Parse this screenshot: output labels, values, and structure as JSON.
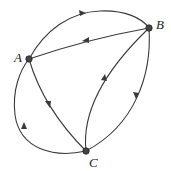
{
  "diagram": {
    "type": "directed-graph",
    "nodes": [
      {
        "id": "A",
        "label": "A",
        "x": 29,
        "y": 59
      },
      {
        "id": "B",
        "label": "B",
        "x": 149,
        "y": 28
      },
      {
        "id": "C",
        "label": "C",
        "x": 86,
        "y": 151
      }
    ],
    "edges": [
      {
        "from": "A",
        "to": "B",
        "shape": "curved-top"
      },
      {
        "from": "B",
        "to": "A",
        "shape": "straight"
      },
      {
        "from": "A",
        "to": "C",
        "shape": "slight-curve"
      },
      {
        "from": "C",
        "to": "B",
        "shape": "curved-inner"
      },
      {
        "from": "B",
        "to": "C",
        "shape": "curved-right"
      },
      {
        "from": "C",
        "to": "A",
        "shape": "curved-left-loop"
      }
    ],
    "colors": {
      "stroke": "#3a3a3a",
      "node": "#444444",
      "background": "#ffffff"
    }
  }
}
